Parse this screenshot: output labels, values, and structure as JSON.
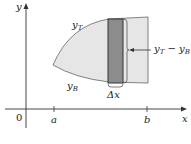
{
  "diagram": {
    "axes": {
      "x_label": "x",
      "y_label": "y",
      "origin_label": "0",
      "tick_a": "a",
      "tick_b": "b"
    },
    "curves": {
      "top_label_base": "y",
      "top_label_sub": "T",
      "bottom_label_base": "y",
      "bottom_label_sub": "B"
    },
    "strip": {
      "width_label": "Δx",
      "height_label_a": "y",
      "height_label_a_sub": "T",
      "height_label_minus": " − ",
      "height_label_b": "y",
      "height_label_b_sub": "B"
    },
    "colors": {
      "region_fill": "#e6e6e6",
      "strip_fill": "#8c8c8c",
      "outline": "#555555",
      "axis": "#333333"
    }
  }
}
